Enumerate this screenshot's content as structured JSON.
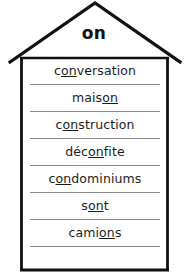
{
  "worksheet": {
    "roof": {
      "label": "on",
      "shape_name": "house-outline"
    },
    "colors": {
      "outline": "#111111",
      "rule": "#8b8b8b",
      "text": "#1b1b1b",
      "background": "#ffffff"
    },
    "rows": [
      {
        "word": "conversation",
        "before": "c",
        "highlight": "on",
        "after": "versation"
      },
      {
        "word": "maison",
        "before": "mais",
        "highlight": "on",
        "after": ""
      },
      {
        "word": "construction",
        "before": "c",
        "highlight": "on",
        "after": "struction"
      },
      {
        "word": "déconfite",
        "before": "déc",
        "highlight": "on",
        "after": "fite"
      },
      {
        "word": "condominiums",
        "before": "c",
        "highlight": "on",
        "after": "dominiums"
      },
      {
        "word": "sont",
        "before": "s",
        "highlight": "on",
        "after": "t"
      },
      {
        "word": "camions",
        "before": "cami",
        "highlight": "on",
        "after": "s"
      }
    ]
  }
}
